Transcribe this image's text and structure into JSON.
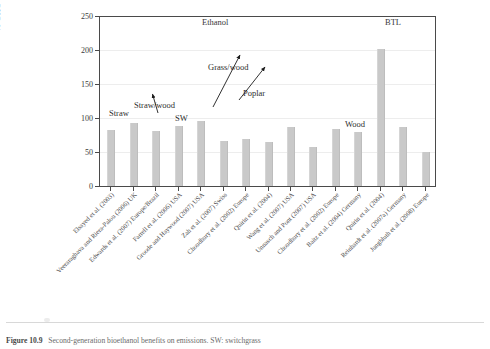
{
  "figure": {
    "caption_number": "Figure 10.9",
    "caption_text": "Second-generation bioethanol benefits on emissions. SW: switchgrass"
  },
  "chart_data": {
    "type": "bar",
    "title": "",
    "xlabel": "",
    "ylabel": "% GHG improvement",
    "ylim": [
      0,
      250
    ],
    "yticks": [
      0,
      50,
      100,
      150,
      200,
      250
    ],
    "ytick_labels": [
      "0",
      "50",
      "100",
      "150",
      "200",
      "250"
    ],
    "grid": true,
    "legend": "none",
    "bar_color": "#c9c9c9",
    "group_labels": [
      {
        "label": "Ethanol",
        "center_index": 5
      },
      {
        "label": "BTL",
        "center_index": 12
      }
    ],
    "categories": [
      "Elsayed et al. (2003)",
      "Veeraraghava and Riera-Palou (2006) UK",
      "Edwards et al. (2007) Europe/Brazil",
      "Farrell et al. (2006) USA",
      "Groode and Haywood (2007) USA",
      "Zah et al. (2007) Swiss",
      "Choudhury et al. (2002) Europe",
      "Quirin et al. (2004)",
      "Wang et al. (2007) USA",
      "Unnasch and Pont (2007) USA",
      "Choudhury et al. (2002) Europe",
      "Baitz et al. (2004) Germany",
      "Quirin et al. (2004)",
      "Reinhardt et al. (2007a) Germany",
      "Jungbluth et al. (2008) Europe"
    ],
    "values": [
      83,
      93,
      82,
      89,
      96,
      67,
      70,
      65,
      88,
      57,
      85,
      80,
      202,
      87,
      51
    ],
    "annotations": [
      {
        "text": "Straw",
        "target_index": 0,
        "has_arrow": false
      },
      {
        "text": "Straw/wood",
        "target_index": 2,
        "has_arrow": true
      },
      {
        "text": "SW",
        "target_index": 3,
        "has_arrow": false
      },
      {
        "text": "Grass/wood",
        "target_index": 5,
        "has_arrow": true
      },
      {
        "text": "Poplar",
        "target_index": 6,
        "has_arrow": true
      },
      {
        "text": "Wood",
        "target_index": 10,
        "has_arrow": false
      }
    ]
  }
}
